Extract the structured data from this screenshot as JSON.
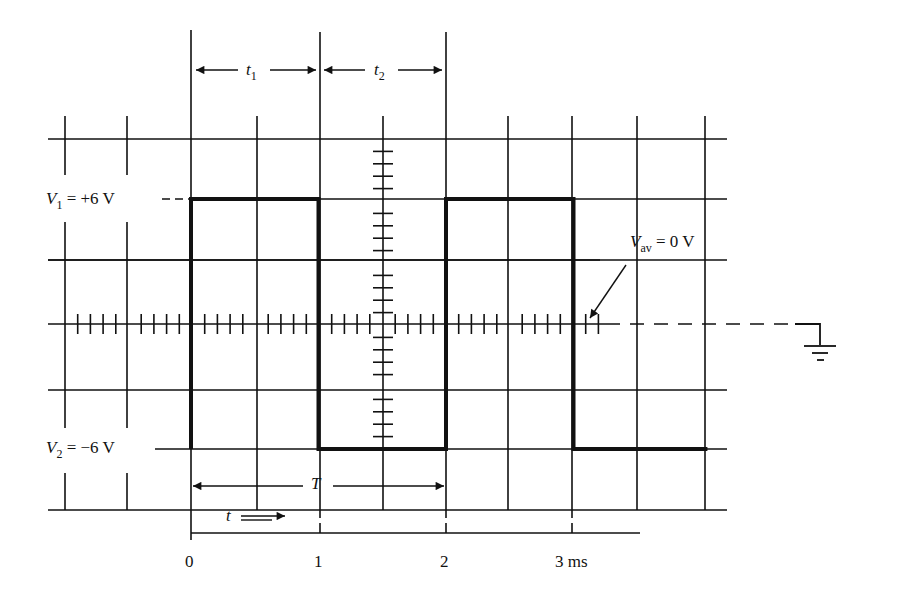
{
  "chart_data": {
    "type": "line",
    "title": "",
    "xlabel": "t",
    "x_unit": "ms",
    "x_tick_labels": [
      "0",
      "1",
      "2",
      "3 ms"
    ],
    "x_ticks": [
      0,
      1,
      2,
      3
    ],
    "series": [
      {
        "name": "square-wave",
        "points": [
          [
            0,
            6
          ],
          [
            1,
            6
          ],
          [
            1,
            -6
          ],
          [
            2,
            -6
          ],
          [
            2,
            6
          ],
          [
            3,
            6
          ],
          [
            3,
            -6
          ],
          [
            4.05,
            -6
          ]
        ]
      }
    ],
    "levels": {
      "v1": {
        "symbol": "V",
        "sub": "1",
        "text": "= +6 V",
        "value": 6
      },
      "v2": {
        "symbol": "V",
        "sub": "2",
        "text": "= −6 V",
        "value": -6
      },
      "vav": {
        "symbol": "V",
        "sub": "av",
        "text": "= 0 V",
        "value": 0
      }
    },
    "dimensions": {
      "t1": {
        "symbol": "t",
        "sub": "1",
        "from": 0,
        "to": 1
      },
      "t2": {
        "symbol": "t",
        "sub": "2",
        "from": 1,
        "to": 2
      },
      "T": {
        "symbol": "T",
        "from": 0,
        "to": 2
      },
      "t_arrow": {
        "symbol": "t"
      }
    },
    "ylim": [
      -8,
      10
    ],
    "grid": true
  },
  "labels": {
    "v1_symbol": "V",
    "v1_sub": "1",
    "v1_text": " = +6 V",
    "v2_symbol": "V",
    "v2_sub": "2",
    "v2_text": " = −6 V",
    "vav_symbol": "V",
    "vav_sub": "av",
    "vav_text": " = 0 V",
    "t1_symbol": "t",
    "t1_sub": "1",
    "t2_symbol": "t",
    "t2_sub": "2",
    "T_symbol": "T",
    "t_symbol": "t",
    "x0": "0",
    "x1": "1",
    "x2": "2",
    "x3": "3 ms"
  },
  "colors": {
    "ink": "#111111",
    "background": "#ffffff"
  }
}
